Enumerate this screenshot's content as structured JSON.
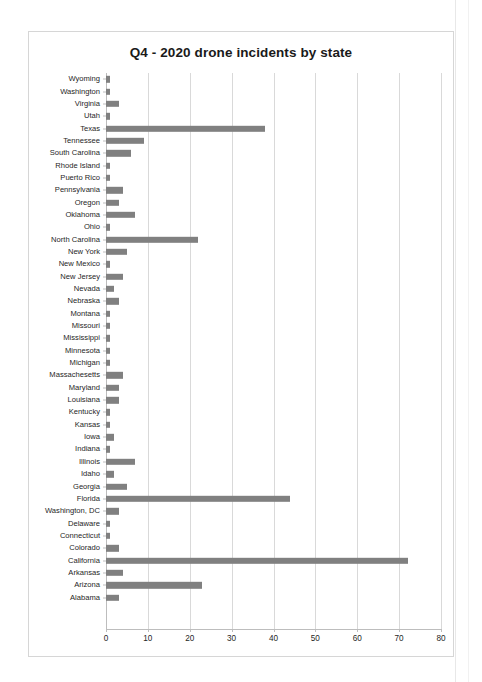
{
  "chart_data": {
    "type": "bar",
    "orientation": "horizontal",
    "title": "Q4 - 2020 drone incidents by state",
    "xlabel": "",
    "ylabel": "",
    "xlim": [
      0,
      80
    ],
    "xticks": [
      0,
      10,
      20,
      30,
      40,
      50,
      60,
      70,
      80
    ],
    "grid": true,
    "legend": false,
    "bar_color": "#808080",
    "categories": [
      "Wyoming",
      "Washington",
      "Virginia",
      "Utah",
      "Texas",
      "Tennessee",
      "South Carolina",
      "Rhode Island",
      "Puerto Rico",
      "Pennsylvania",
      "Oregon",
      "Oklahoma",
      "Ohio",
      "North Carolina",
      "New York",
      "New Mexico",
      "New Jersey",
      "Nevada",
      "Nebraska",
      "Montana",
      "Missouri",
      "Mississippi",
      "Minnesota",
      "Michigan",
      "Massachesetts",
      "Maryland",
      "Louisiana",
      "Kentucky",
      "Kansas",
      "Iowa",
      "Indiana",
      "Illinois",
      "Idaho",
      "Georgia",
      "Florida",
      "Washington, DC",
      "Delaware",
      "Connecticut",
      "Colorado",
      "California",
      "Arkansas",
      "Arizona",
      "Alabama"
    ],
    "values": [
      1,
      1,
      3,
      1,
      38,
      9,
      6,
      1,
      1,
      4,
      3,
      7,
      1,
      22,
      5,
      1,
      4,
      2,
      3,
      1,
      1,
      1,
      1,
      1,
      4,
      3,
      3,
      1,
      1,
      2,
      1,
      7,
      2,
      5,
      44,
      3,
      1,
      1,
      3,
      72,
      4,
      23,
      3
    ]
  }
}
